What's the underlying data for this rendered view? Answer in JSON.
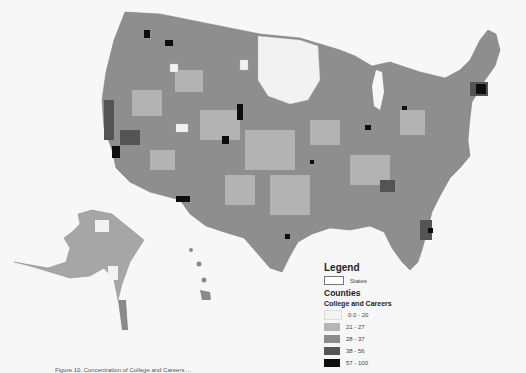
{
  "map": {
    "title": "College and Careers by County",
    "regions_shown": [
      "Contiguous United States",
      "Alaska",
      "Hawaii"
    ]
  },
  "legend": {
    "title": "Legend",
    "states_label": "States",
    "counties_label": "Counties",
    "variable_label": "College and Careers",
    "classes": [
      {
        "label": "0.0 - 20",
        "color": "#f4f4f4"
      },
      {
        "label": "21 - 27",
        "color": "#b5b5b5"
      },
      {
        "label": "28 - 37",
        "color": "#8c8c8c"
      },
      {
        "label": "38 - 56",
        "color": "#555555"
      },
      {
        "label": "57 - 100",
        "color": "#0d0d0d"
      }
    ]
  },
  "caption": "Figure 10. Concentration of College and Careers ..."
}
